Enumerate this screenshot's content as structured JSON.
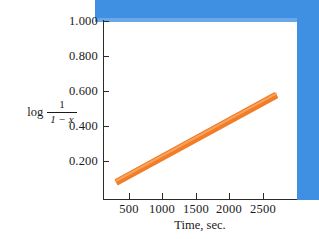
{
  "figure": {
    "background_color": "#ffffff",
    "artifact_color": "#3f90e2",
    "line_color": "#f07d28",
    "axis_color": "#2b2b2b"
  },
  "chart_data": {
    "type": "line",
    "title": "",
    "subtitle": "",
    "xlabel": "Time, sec.",
    "ylabel": "log 1/(1 - x)",
    "ylabel_parts": {
      "log": "log",
      "numerator": "1",
      "denominator": "1 − x"
    },
    "xlim": [
      0,
      2900
    ],
    "ylim": [
      0,
      1.08
    ],
    "grid": false,
    "legend": null,
    "xticks": [
      500,
      1000,
      1500,
      2000,
      2500
    ],
    "xtick_labels": [
      "500",
      "1000",
      "1500",
      "2000",
      "2500"
    ],
    "yticks": [
      0.2,
      0.4,
      0.6,
      0.8,
      1.0
    ],
    "ytick_labels": [
      "0.200",
      "0.400",
      "0.600",
      "0.800",
      "1.000"
    ],
    "series": [
      {
        "name": "log 1/(1 - x) vs time",
        "style": "thick straight band",
        "color": "#f07d28",
        "x": [
          200,
          2600
        ],
        "y": [
          0.105,
          0.63
        ],
        "endpoints": {
          "start": {
            "x": 200,
            "y": 0.105
          },
          "end": {
            "x": 2600,
            "y": 0.63
          }
        },
        "slope_per_sec": 0.000219
      }
    ],
    "annotations": [
      {
        "name": "scan-edge-artifact",
        "description": "blue band along top and right edge of scanned figure",
        "color": "#3f90e2"
      }
    ]
  },
  "axes": {
    "y_tick_labels": [
      "1.000",
      "0.800",
      "0.600",
      "0.400",
      "0.200"
    ],
    "x_tick_labels": [
      "500",
      "1000",
      "1500",
      "2000",
      "2500"
    ],
    "x_axis_title": "Time, sec."
  }
}
